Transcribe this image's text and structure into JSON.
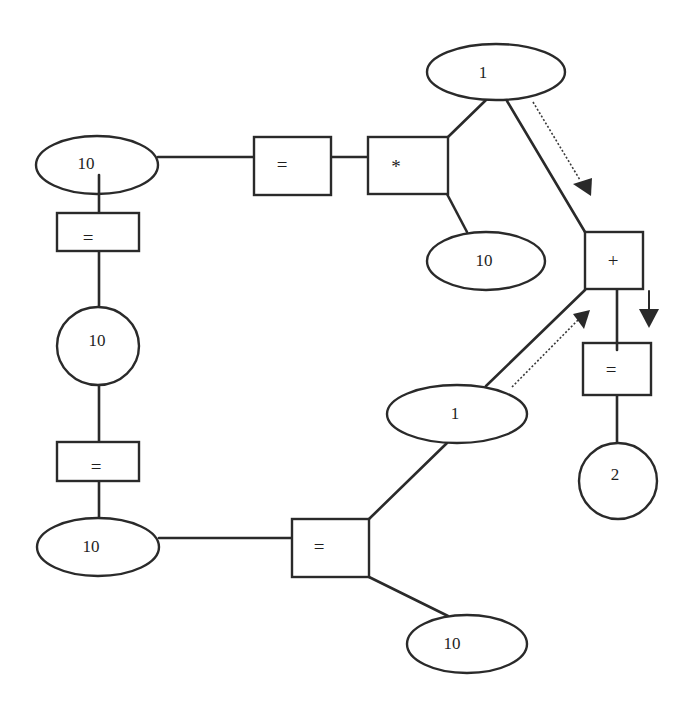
{
  "diagram": {
    "title": "",
    "nodes": {
      "left_top_10": {
        "label": "10",
        "shape": "ellipse"
      },
      "top_eq": {
        "label": "=",
        "shape": "box"
      },
      "mult": {
        "label": "*",
        "shape": "box"
      },
      "top_1": {
        "label": "1",
        "shape": "ellipse"
      },
      "mid_10": {
        "label": "10",
        "shape": "ellipse"
      },
      "plus": {
        "label": "+",
        "shape": "box"
      },
      "left_eq_1": {
        "label": "=",
        "shape": "box"
      },
      "left_circle_10": {
        "label": "10",
        "shape": "circle"
      },
      "left_eq_2": {
        "label": "=",
        "shape": "box"
      },
      "bottom_left_10": {
        "label": "10",
        "shape": "ellipse"
      },
      "bottom_eq": {
        "label": "=",
        "shape": "box"
      },
      "bottom_10": {
        "label": "10",
        "shape": "ellipse"
      },
      "mid_1": {
        "label": "1",
        "shape": "ellipse"
      },
      "right_eq": {
        "label": "=",
        "shape": "box"
      },
      "result_2": {
        "label": "2",
        "shape": "circle"
      }
    },
    "edges": [
      [
        "left_top_10",
        "top_eq"
      ],
      [
        "top_eq",
        "mult"
      ],
      [
        "mult",
        "top_1"
      ],
      [
        "mult",
        "mid_10"
      ],
      [
        "top_1",
        "plus"
      ],
      [
        "left_top_10",
        "left_eq_1"
      ],
      [
        "left_eq_1",
        "left_circle_10"
      ],
      [
        "left_circle_10",
        "left_eq_2"
      ],
      [
        "left_eq_2",
        "bottom_left_10"
      ],
      [
        "bottom_left_10",
        "bottom_eq"
      ],
      [
        "bottom_eq",
        "mid_1"
      ],
      [
        "bottom_eq",
        "bottom_10"
      ],
      [
        "mid_1",
        "plus"
      ],
      [
        "plus",
        "right_eq"
      ],
      [
        "right_eq",
        "result_2"
      ]
    ],
    "flow_arrows": [
      {
        "from": "top_1",
        "to": "plus",
        "style": "dotted"
      },
      {
        "from": "mid_1",
        "to": "plus",
        "style": "dotted"
      },
      {
        "from": "plus",
        "to": "right_eq",
        "style": "solid"
      }
    ]
  }
}
